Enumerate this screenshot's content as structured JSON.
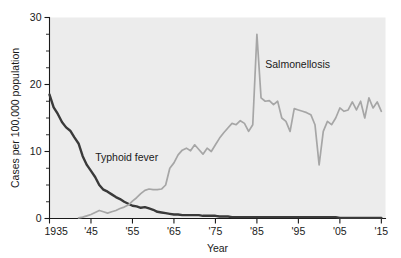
{
  "chart_data": {
    "type": "line",
    "title": "",
    "xlabel": "Year",
    "ylabel": "Cases per 100,000 population",
    "xlim": [
      1935,
      2016
    ],
    "ylim": [
      0,
      30
    ],
    "grid": false,
    "legend_position": "inline-annotations",
    "y_ticks": [
      0,
      10,
      20,
      30
    ],
    "y_tick_labels": [
      "0",
      "10",
      "20",
      "30"
    ],
    "y_minor_step": 2.5,
    "x_ticks": [
      1935,
      1945,
      1955,
      1965,
      1975,
      1985,
      1995,
      2005,
      2015
    ],
    "x_tick_labels": [
      "1935",
      "'45",
      "'55",
      "'65",
      "'75",
      "'85",
      "'95",
      "'05",
      "'15"
    ],
    "series": [
      {
        "name": "Typhoid fever",
        "color": "#3a3a3a",
        "label_x": 1946,
        "label_y": 8.6,
        "x": [
          1935,
          1936,
          1937,
          1938,
          1939,
          1940,
          1941,
          1942,
          1943,
          1944,
          1945,
          1946,
          1947,
          1948,
          1949,
          1950,
          1951,
          1952,
          1953,
          1954,
          1955,
          1956,
          1957,
          1958,
          1959,
          1960,
          1961,
          1962,
          1963,
          1964,
          1965,
          1966,
          1967,
          1968,
          1969,
          1970,
          1971,
          1972,
          1973,
          1974,
          1975,
          1976,
          1977,
          1978,
          1979,
          1980,
          1981,
          1982,
          1983,
          1984,
          1985,
          1986,
          1987,
          1988,
          1989,
          1990,
          1991,
          1992,
          1993,
          1994,
          1995,
          1996,
          1997,
          1998,
          1999,
          2000,
          2001,
          2002,
          2003,
          2004,
          2005,
          2006,
          2007,
          2008,
          2009,
          2010,
          2011,
          2012,
          2013,
          2014,
          2015
        ],
        "values": [
          18.5,
          16.6,
          15.6,
          14.4,
          13.6,
          13.1,
          12.1,
          11.2,
          9.3,
          8.0,
          7.1,
          6.2,
          5.0,
          4.3,
          4.0,
          3.6,
          3.2,
          2.9,
          2.5,
          2.2,
          1.9,
          1.8,
          1.6,
          1.7,
          1.5,
          1.3,
          1.0,
          0.9,
          0.8,
          0.7,
          0.6,
          0.6,
          0.5,
          0.5,
          0.5,
          0.5,
          0.5,
          0.4,
          0.4,
          0.4,
          0.4,
          0.3,
          0.3,
          0.3,
          0.2,
          0.2,
          0.2,
          0.2,
          0.2,
          0.2,
          0.2,
          0.2,
          0.2,
          0.2,
          0.2,
          0.2,
          0.2,
          0.2,
          0.2,
          0.2,
          0.2,
          0.2,
          0.2,
          0.2,
          0.2,
          0.2,
          0.2,
          0.2,
          0.2,
          0.2,
          0.1,
          0.1,
          0.1,
          0.1,
          0.1,
          0.1,
          0.1,
          0.1,
          0.1,
          0.1,
          0.1
        ]
      },
      {
        "name": "Salmonellosis",
        "color": "#a6a6a6",
        "label_x": 1987,
        "label_y": 22.4,
        "x": [
          1942,
          1943,
          1944,
          1945,
          1946,
          1947,
          1948,
          1949,
          1950,
          1951,
          1952,
          1953,
          1954,
          1955,
          1956,
          1957,
          1958,
          1959,
          1960,
          1961,
          1962,
          1963,
          1964,
          1965,
          1966,
          1967,
          1968,
          1969,
          1970,
          1971,
          1972,
          1973,
          1974,
          1975,
          1976,
          1977,
          1978,
          1979,
          1980,
          1981,
          1982,
          1983,
          1984,
          1985,
          1986,
          1987,
          1988,
          1989,
          1990,
          1991,
          1992,
          1993,
          1994,
          1995,
          1996,
          1997,
          1998,
          1999,
          2000,
          2001,
          2002,
          2003,
          2004,
          2005,
          2006,
          2007,
          2008,
          2009,
          2010,
          2011,
          2012,
          2013,
          2014,
          2015
        ],
        "values": [
          0.1,
          0.2,
          0.4,
          0.6,
          0.9,
          1.2,
          1.0,
          0.8,
          1.0,
          1.2,
          1.5,
          1.7,
          2.0,
          2.6,
          3.1,
          3.7,
          4.2,
          4.4,
          4.3,
          4.3,
          4.4,
          5.0,
          7.5,
          8.3,
          9.5,
          10.2,
          10.5,
          10.1,
          11.0,
          10.3,
          9.6,
          10.5,
          10.0,
          11.0,
          12.0,
          12.8,
          13.5,
          14.2,
          14.0,
          14.6,
          14.2,
          13.0,
          14.0,
          27.5,
          18.0,
          17.5,
          17.6,
          17.0,
          17.5,
          15.0,
          14.5,
          13.0,
          16.4,
          16.2,
          16.0,
          15.8,
          15.5,
          14.0,
          8.0,
          13.0,
          14.5,
          14.0,
          15.0,
          16.5,
          16.0,
          16.2,
          17.4,
          16.2,
          17.5,
          15.0,
          18.0,
          16.5,
          17.4,
          16.0
        ]
      }
    ]
  },
  "annotations": {
    "typhoid_label": "Typhoid fever",
    "salmonellosis_label": "Salmonellosis"
  }
}
